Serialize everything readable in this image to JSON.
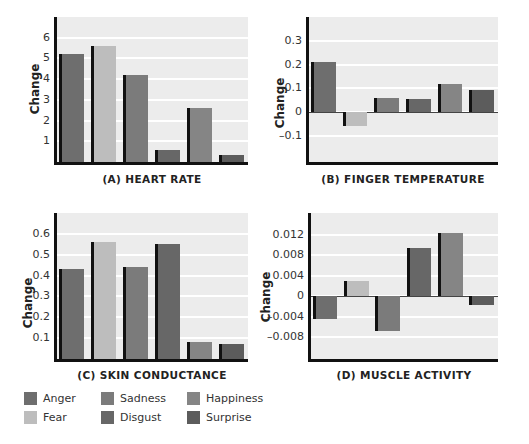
{
  "colors": {
    "Anger": "#6e6e6e",
    "Fear": "#bdbdbd",
    "Sadness": "#7b7b7b",
    "Disgust": "#676767",
    "Happiness": "#858585",
    "Surprise": "#5c5c5c",
    "plot_bg": "#ececec",
    "grid": "#ffffff"
  },
  "legend": {
    "items": [
      {
        "label": "Anger",
        "color": "#6e6e6e"
      },
      {
        "label": "Sadness",
        "color": "#7b7b7b"
      },
      {
        "label": "Happiness",
        "color": "#858585"
      },
      {
        "label": "Fear",
        "color": "#bdbdbd"
      },
      {
        "label": "Disgust",
        "color": "#676767"
      },
      {
        "label": "Surprise",
        "color": "#5c5c5c"
      }
    ]
  },
  "chart_data": [
    {
      "type": "bar",
      "title": "(A) HEART RATE",
      "xlabel": "",
      "ylabel": "Change",
      "categories": [
        "Anger",
        "Fear",
        "Sadness",
        "Disgust",
        "Happiness",
        "Surprise"
      ],
      "values": [
        5.2,
        5.6,
        4.2,
        0.6,
        2.6,
        0.35
      ],
      "yticks": [
        "1",
        "2",
        "3",
        "4",
        "5",
        "6"
      ],
      "ylim": [
        0,
        7
      ],
      "grid": true
    },
    {
      "type": "bar",
      "title": "(B) FINGER TEMPERATURE",
      "xlabel": "",
      "ylabel": "Change",
      "categories": [
        "Anger",
        "Fear",
        "Sadness",
        "Disgust",
        "Happiness",
        "Surprise"
      ],
      "values": [
        0.21,
        -0.06,
        0.06,
        0.055,
        0.12,
        0.095
      ],
      "yticks": [
        "-0.1",
        "0",
        "0.1",
        "0.2",
        "0.3"
      ],
      "ylim": [
        -0.21,
        0.4
      ],
      "grid": true
    },
    {
      "type": "bar",
      "title": "(C) SKIN CONDUCTANCE",
      "xlabel": "",
      "ylabel": "Change",
      "categories": [
        "Anger",
        "Fear",
        "Sadness",
        "Disgust",
        "Happiness",
        "Surprise"
      ],
      "values": [
        0.43,
        0.56,
        0.44,
        0.55,
        0.08,
        0.07
      ],
      "yticks": [
        "0.1",
        "0.2",
        "0.3",
        "0.4",
        "0.5",
        "0.6"
      ],
      "ylim": [
        0,
        0.7
      ],
      "grid": true
    },
    {
      "type": "bar",
      "title": "(D) MUSCLE ACTIVITY",
      "xlabel": "",
      "ylabel": "Change",
      "categories": [
        "Anger",
        "Fear",
        "Sadness",
        "Disgust",
        "Happiness",
        "Surprise"
      ],
      "values": [
        -0.0044,
        0.003,
        -0.0068,
        0.0094,
        0.0124,
        -0.0017
      ],
      "yticks": [
        "-0.008",
        "-0.004",
        "0",
        "0.004",
        "0.008",
        "0.012"
      ],
      "ylim": [
        -0.0122,
        0.0162
      ],
      "grid": true
    }
  ]
}
